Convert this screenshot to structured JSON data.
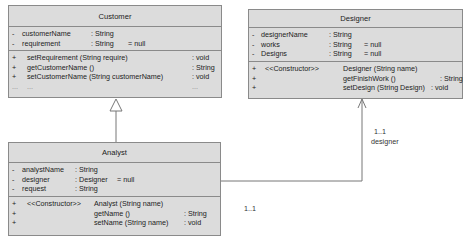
{
  "classes": {
    "customer": {
      "name": "Customer",
      "attributes": [
        {
          "vis": "-",
          "name": "customerName",
          "type": ": String",
          "default": ""
        },
        {
          "vis": "-",
          "name": "requirement",
          "type": ": String",
          "default": "= null"
        }
      ],
      "methods": [
        {
          "vis": "+",
          "stereo": "",
          "sig": "setRequirement (String require)",
          "ret": ": void"
        },
        {
          "vis": "+",
          "stereo": "",
          "sig": "getCustomerName ()",
          "ret": ": String"
        },
        {
          "vis": "+",
          "stereo": "",
          "sig": "setCustomerName (String customerName)",
          "ret": ": void"
        },
        {
          "vis": "...",
          "stereo": "",
          "sig": "...",
          "ret": "..."
        }
      ]
    },
    "designer": {
      "name": "Designer",
      "attributes": [
        {
          "vis": "-",
          "name": "designerName",
          "type": ": String",
          "default": ""
        },
        {
          "vis": "-",
          "name": "works",
          "type": ": String",
          "default": "= null"
        },
        {
          "vis": "-",
          "name": "Designs",
          "type": ": String",
          "default": "= null"
        }
      ],
      "methods": [
        {
          "vis": "+",
          "stereo": "<<Constructor>>",
          "sig": "Designer (String name)",
          "ret": ""
        },
        {
          "vis": "+",
          "stereo": "",
          "sig": "getFinishWork ()",
          "ret": ": String"
        },
        {
          "vis": "+",
          "stereo": "",
          "sig": "setDesign (String Design)",
          "ret": ": void"
        }
      ]
    },
    "analyst": {
      "name": "Analyst",
      "attributes": [
        {
          "vis": "-",
          "name": "analystName",
          "type": ": String",
          "default": ""
        },
        {
          "vis": "-",
          "name": "designer",
          "type": ": Designer",
          "default": "= null"
        },
        {
          "vis": "-",
          "name": "request",
          "type": ": String",
          "default": ""
        }
      ],
      "methods": [
        {
          "vis": "+",
          "stereo": "<<Constructor>>",
          "sig": "Analyst (String name)",
          "ret": ""
        },
        {
          "vis": "+",
          "stereo": "",
          "sig": "getName ()",
          "ret": ": String"
        },
        {
          "vis": "+",
          "stereo": "",
          "sig": "setName (String name)",
          "ret": ": void"
        }
      ]
    }
  },
  "relations": {
    "inheritance": {
      "from": "Analyst",
      "to": "Customer"
    },
    "association": {
      "from": "Analyst",
      "to": "Designer",
      "source_multiplicity": "1..1",
      "target_multiplicity": "1..1",
      "target_role": "designer"
    }
  },
  "colors": {
    "box_fill": "#dcdcdc",
    "border": "#8a8a8a",
    "line": "#777777"
  }
}
